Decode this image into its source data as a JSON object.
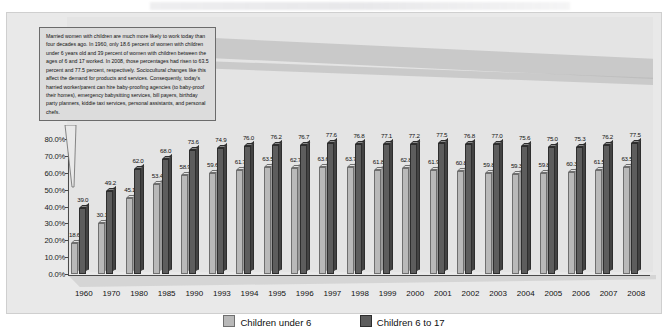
{
  "callout": {
    "text": "Married women with children are much more likely to work today than four decades ago. In 1960, only 18.6 percent of women with children under 6 years old and 39 percent of women with children between the ages of 6 and 17 worked. In 2008, those percentages had risen to 63.5 percent and 77.5 percent, respectively. Sociocultural changes like this affect the demand for products and services. Consequently, today's harried worker/parent can hire baby-proofing agencies (to baby-proof their homes), emergency babysitting services, bill payers, birthday party planners, kiddie taxi services, personal assistants, and personal chefs."
  },
  "legend": {
    "under6": "Children under 6",
    "six_to_17": "Children 6 to 17"
  },
  "colors": {
    "light_bar": "#b9b9b9",
    "dark_bar": "#5d5d5d",
    "panel": "#e9e9e9",
    "callout": "#dcdcdc",
    "axis": "#4a4a4a"
  },
  "chart_data": {
    "type": "bar",
    "title": "",
    "xlabel": "",
    "ylabel": "",
    "ylim": [
      0,
      80
    ],
    "ytick_labels": [
      "0.0%",
      "10.0%",
      "20.0%",
      "30.0%",
      "40.0%",
      "50.0%",
      "60.0%",
      "70.0%",
      "80.0%"
    ],
    "ytick_values": [
      0,
      10,
      20,
      30,
      40,
      50,
      60,
      70,
      80
    ],
    "grid": false,
    "legend_position": "bottom",
    "categories": [
      "1960",
      "1970",
      "1980",
      "1985",
      "1990",
      "1993",
      "1994",
      "1995",
      "1996",
      "1997",
      "1998",
      "1999",
      "2000",
      "2001",
      "2002",
      "2003",
      "2004",
      "2005",
      "2006",
      "2007",
      "2008"
    ],
    "series": [
      {
        "name": "Children under 6",
        "color": "#b9b9b9",
        "values": [
          18.6,
          30.1,
          45.1,
          53.4,
          58.9,
          59.6,
          61.7,
          63.5,
          62.7,
          63.6,
          63.7,
          61.8,
          62.8,
          61.9,
          60.8,
          59.8,
          59.3,
          59.8,
          60.3,
          61.5,
          63.5
        ]
      },
      {
        "name": "Children 6 to 17",
        "color": "#5d5d5d",
        "values": [
          39.0,
          49.2,
          62.0,
          68.0,
          73.6,
          74.9,
          76.0,
          76.2,
          76.7,
          77.6,
          76.8,
          77.1,
          77.2,
          77.5,
          76.8,
          77.0,
          75.6,
          75.0,
          75.3,
          76.2,
          77.5
        ]
      }
    ]
  }
}
